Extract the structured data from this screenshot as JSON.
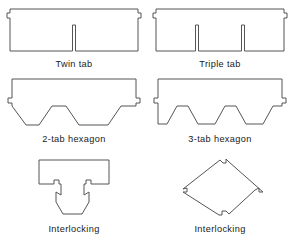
{
  "figure": {
    "background_color": "#ffffff",
    "outline_color": "#555555",
    "fill_color": "#ffffff",
    "text_color": "#191919",
    "cells": [
      {
        "id": "twin-tab",
        "caption": "Twin tab",
        "shape": "rectangular shingle with one central slot and edge alignment notches",
        "tabs": 2,
        "slots": 1
      },
      {
        "id": "triple-tab",
        "caption": "Triple tab",
        "shape": "rectangular shingle with two slots and edge alignment notches",
        "tabs": 3,
        "slots": 2
      },
      {
        "id": "two-tab-hexagon",
        "caption": "2-tab hexagon",
        "shape": "shingle with two hexagonal tabs formed by angled bottom cutouts",
        "tabs": 2,
        "slots": 2
      },
      {
        "id": "three-tab-hexagon",
        "caption": "3-tab hexagon",
        "shape": "shingle with three hexagonal tabs formed by angled bottom cutouts",
        "tabs": 3,
        "slots": 3
      },
      {
        "id": "interlocking-t",
        "caption": "Interlocking",
        "shape": "T-shaped interlocking shingle with locking tabs and notches",
        "tabs": 1,
        "slots": 0
      },
      {
        "id": "interlocking-diamond",
        "caption": "Interlocking",
        "shape": "diamond-shaped interlocking shingle with locking notches at each vertex",
        "tabs": 1,
        "slots": 0
      }
    ]
  }
}
